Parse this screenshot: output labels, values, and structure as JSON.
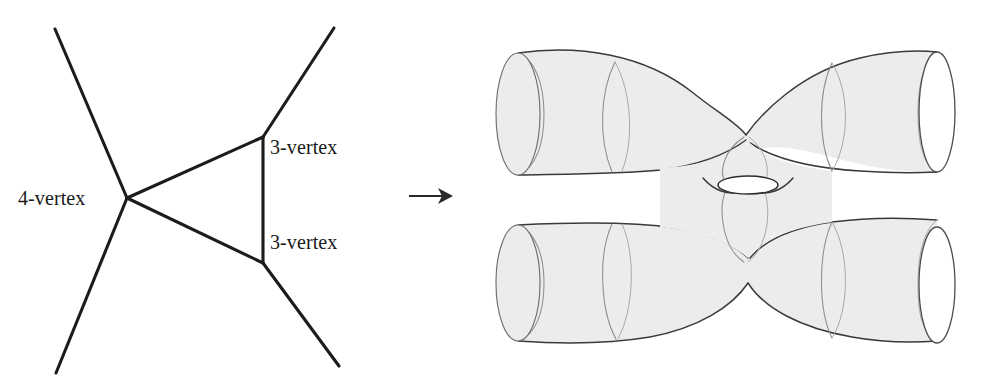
{
  "figure": {
    "type": "diagram",
    "background_color": "#ffffff",
    "ink_color": "#1c1c1c",
    "surface_fill_color": "#ececec",
    "surface_outline_color": "#4c4c4c"
  },
  "graph": {
    "labels": {
      "four_vertex": "4-vertex",
      "three_vertex_top": "3-vertex",
      "three_vertex_bottom": "3-vertex"
    },
    "vertices": [
      {
        "name": "4-vertex",
        "valence": 4,
        "x": 127,
        "y": 198
      },
      {
        "name": "3-vertex-top",
        "valence": 3,
        "x": 263,
        "y": 137
      },
      {
        "name": "3-vertex-bottom",
        "valence": 3,
        "x": 263,
        "y": 263
      }
    ],
    "external_legs": [
      {
        "from": "4-vertex",
        "to_x": 55,
        "to_y": 29
      },
      {
        "from": "4-vertex",
        "to_x": 56,
        "to_y": 373
      },
      {
        "from": "3-vertex-top",
        "to_x": 334,
        "to_y": 28
      },
      {
        "from": "3-vertex-bottom",
        "to_x": 339,
        "to_y": 366
      }
    ],
    "internal_edges": [
      {
        "from": "4-vertex",
        "to": "3-vertex-top"
      },
      {
        "from": "4-vertex",
        "to": "3-vertex-bottom"
      },
      {
        "from": "3-vertex-top",
        "to": "3-vertex-bottom"
      }
    ]
  },
  "arrow": {
    "glyph": "→",
    "x1": 409,
    "y1": 196,
    "x2": 452,
    "y2": 196
  },
  "surface": {
    "genus": 1,
    "boundary_circles": 4,
    "openings": [
      {
        "name": "top-left",
        "facing": "back",
        "cx": 518,
        "cy": 114,
        "rx": 22,
        "ry": 61
      },
      {
        "name": "bottom-left",
        "facing": "back",
        "cx": 518,
        "cy": 283,
        "rx": 22,
        "ry": 58
      },
      {
        "name": "top-right",
        "facing": "front",
        "cx": 937,
        "cy": 112,
        "rx": 18,
        "ry": 60
      },
      {
        "name": "bottom-right",
        "facing": "front",
        "cx": 937,
        "cy": 285,
        "rx": 18,
        "ry": 58
      }
    ],
    "seam_curves": 6,
    "handle": {
      "cx": 736,
      "cy": 183,
      "rx": 30,
      "ry": 9
    }
  }
}
